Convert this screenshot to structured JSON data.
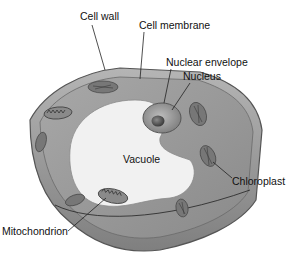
{
  "figure": {
    "labels": {
      "cell_wall": "Cell wall",
      "cell_membrane": "Cell membrane",
      "nuclear_envelope": "Nuclear envelope",
      "nucleus": "Nucleus",
      "vacuole": "Vacuole",
      "chloroplast": "Chloroplast",
      "mitochondrion": "Mitochondrion"
    },
    "colors": {
      "background": "#ffffff",
      "cell_wall": "#7a7a7a",
      "cytoplasm": "#9a9a9a",
      "vacuole": "#f2f2f2",
      "nucleus": "#8c8c8c",
      "nucleolus": "#4a4a4a",
      "organelle": "#6e6e6e",
      "text": "#111111"
    }
  }
}
